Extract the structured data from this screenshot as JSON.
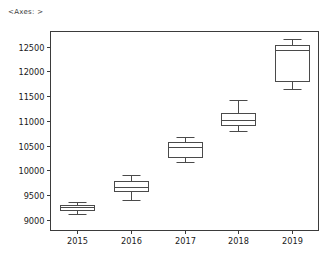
{
  "repr_label": "<Axes: >",
  "chart_data": {
    "type": "box",
    "title": "",
    "xlabel": "",
    "ylabel": "",
    "categories": [
      "2015",
      "2016",
      "2017",
      "2018",
      "2019"
    ],
    "ylim": [
      8780,
      12810
    ],
    "yticks": [
      9000,
      9500,
      10000,
      10500,
      11000,
      11500,
      12000,
      12500
    ],
    "ytick_labels": [
      "9000",
      "9500",
      "10000",
      "10500",
      "11000",
      "11500",
      "12000",
      "12500"
    ],
    "grid": false,
    "legend": null,
    "boxes": [
      {
        "category": "2015",
        "whisker_low": 9120,
        "q1": 9190,
        "median": 9250,
        "q3": 9290,
        "whisker_high": 9350
      },
      {
        "category": "2016",
        "whisker_low": 9400,
        "q1": 9570,
        "median": 9670,
        "q3": 9780,
        "whisker_high": 9900
      },
      {
        "category": "2017",
        "whisker_low": 10160,
        "q1": 10270,
        "median": 10480,
        "q3": 10570,
        "whisker_high": 10670
      },
      {
        "category": "2018",
        "whisker_low": 10790,
        "q1": 10920,
        "median": 11020,
        "q3": 11150,
        "whisker_high": 11420
      },
      {
        "category": "2019",
        "whisker_low": 11640,
        "q1": 11810,
        "median": 12440,
        "q3": 12540,
        "whisker_high": 12650
      }
    ]
  },
  "colors": {
    "box_stroke": "#4a4a4a",
    "box_fill": "#ffffff",
    "axis": "#3b3b3b",
    "text": "#1a1a1a",
    "background": "#ffffff"
  }
}
